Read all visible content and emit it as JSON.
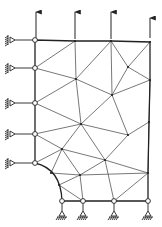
{
  "diagram": {
    "type": "finite-element-mesh",
    "colors": {
      "line": "#555555",
      "boundary": "#222222",
      "background": "#ffffff"
    },
    "nodes": {
      "L1": [
        35,
        40
      ],
      "T2": [
        75,
        41
      ],
      "T3": [
        111,
        41
      ],
      "T4": [
        150,
        42
      ],
      "L2": [
        35,
        68
      ],
      "L3": [
        35,
        103
      ],
      "L4": [
        35,
        134
      ],
      "L5": [
        35,
        163
      ],
      "M1": [
        76,
        79
      ],
      "M2": [
        128,
        67
      ],
      "M3": [
        112,
        95
      ],
      "M4": [
        81,
        124
      ],
      "M5": [
        128,
        135
      ],
      "M6": [
        62,
        149
      ],
      "M7": [
        105,
        160
      ],
      "M8": [
        80,
        175
      ],
      "R1": [
        150,
        80
      ],
      "R2": [
        149,
        122
      ],
      "R3": [
        148,
        173
      ],
      "A1": [
        51,
        173
      ],
      "A2": [
        59,
        185
      ],
      "B1": [
        62,
        201
      ],
      "B2": [
        83,
        201
      ],
      "B3": [
        114,
        201
      ],
      "B4": [
        148,
        201
      ]
    },
    "boundary_nodes": [
      "L1",
      "L2",
      "L3",
      "L4",
      "L5",
      "B1",
      "B2",
      "B3",
      "B4"
    ],
    "interior_nodes": [
      "T2",
      "T3",
      "T4",
      "M1",
      "M2",
      "M3",
      "M4",
      "M5",
      "M6",
      "M7",
      "M8",
      "R1",
      "R2",
      "R3",
      "A1",
      "A2"
    ],
    "boundary_path": [
      "L5",
      "L4",
      "L3",
      "L2",
      "L1",
      "T2",
      "T3",
      "T4",
      "R1",
      "R2",
      "R3",
      "B4",
      "B3",
      "B2",
      "B1"
    ],
    "arc": {
      "from": "L5",
      "to": "B1",
      "via": [
        "A1",
        "A2"
      ]
    },
    "edges": [
      [
        "L2",
        "T2"
      ],
      [
        "L2",
        "M1"
      ],
      [
        "T2",
        "M1"
      ],
      [
        "M1",
        "T3"
      ],
      [
        "T3",
        "M3"
      ],
      [
        "T3",
        "M2"
      ],
      [
        "T4",
        "M2"
      ],
      [
        "M2",
        "R1"
      ],
      [
        "M2",
        "M3"
      ],
      [
        "M1",
        "M3"
      ],
      [
        "L3",
        "M1"
      ],
      [
        "R1",
        "M3"
      ],
      [
        "L3",
        "M4"
      ],
      [
        "L4",
        "M4"
      ],
      [
        "M1",
        "M4"
      ],
      [
        "M3",
        "M4"
      ],
      [
        "M3",
        "M5"
      ],
      [
        "R1",
        "R2"
      ],
      [
        "M5",
        "R2"
      ],
      [
        "M4",
        "M5"
      ],
      [
        "M4",
        "M6"
      ],
      [
        "M4",
        "M7"
      ],
      [
        "L4",
        "M6"
      ],
      [
        "L5",
        "M6"
      ],
      [
        "M6",
        "M7"
      ],
      [
        "M5",
        "M7"
      ],
      [
        "M6",
        "A1"
      ],
      [
        "M6",
        "M8"
      ],
      [
        "M7",
        "M8"
      ],
      [
        "M7",
        "R3"
      ],
      [
        "M7",
        "B3"
      ],
      [
        "M8",
        "A1"
      ],
      [
        "M8",
        "A2"
      ],
      [
        "M8",
        "B2"
      ],
      [
        "M8",
        "R3"
      ],
      [
        "R3",
        "B3"
      ],
      [
        "A2",
        "B2"
      ],
      [
        "R2",
        "R3"
      ]
    ],
    "loads": {
      "direction": "up",
      "arrows": [
        {
          "x": 36,
          "y_start": 38,
          "y_end": 12
        },
        {
          "x": 75,
          "y_start": 39,
          "y_end": 12
        },
        {
          "x": 111,
          "y_start": 39,
          "y_end": 12
        },
        {
          "x": 150,
          "y_start": 38,
          "y_end": 18
        }
      ]
    },
    "supports": {
      "left": [
        [
          35,
          40
        ],
        [
          35,
          68
        ],
        [
          35,
          103
        ],
        [
          35,
          134
        ],
        [
          35,
          163
        ]
      ],
      "bottom": [
        [
          62,
          201
        ],
        [
          83,
          201
        ],
        [
          114,
          201
        ],
        [
          148,
          201
        ]
      ]
    }
  }
}
